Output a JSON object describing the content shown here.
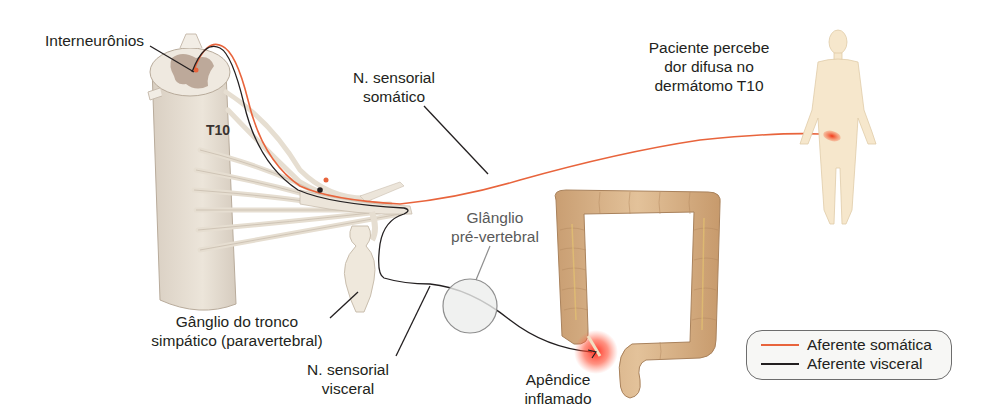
{
  "diagram": {
    "type": "referred-pain-anatomy",
    "labels": {
      "interneurons": "Interneurônios",
      "spinal_level": "T10",
      "somatic_nerve": [
        "N. sensorial",
        "somático"
      ],
      "patient_perception": [
        "Paciente percebe",
        "dor difusa no",
        "dermátomo T10"
      ],
      "prevertebral_ganglion": [
        "Glânglio",
        "pré-vertebral"
      ],
      "sympathetic_ganglion": [
        "Gânglio do tronco",
        "simpático (paravertebral)"
      ],
      "visceral_nerve": [
        "N. sensorial",
        "visceral"
      ],
      "inflamed_appendix": [
        "Apêndice",
        "inflamado"
      ]
    },
    "legend": {
      "items": [
        {
          "label": "Aferente somática",
          "color": "#e8643c"
        },
        {
          "label": "Aferente visceral",
          "color": "#231f20"
        }
      ]
    },
    "colors": {
      "somatic_afferent": "#e8643c",
      "visceral_afferent": "#231f20",
      "spinal_cord": "#e9e1d6",
      "grey_matter": "#bda99a",
      "nerve_fiber": "#efe9df",
      "colon": "#d8b48a",
      "body_skin": "#f6e7cc",
      "inflammation": "#f03a2a"
    }
  }
}
